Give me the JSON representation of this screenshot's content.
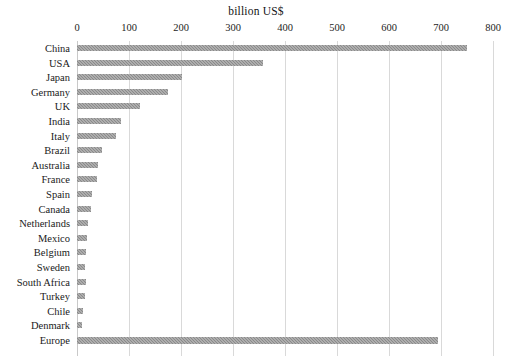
{
  "chart_data": {
    "type": "bar",
    "orientation": "horizontal",
    "title": "billion US$",
    "xlabel": "billion US$",
    "ylabel": "",
    "xlim": [
      0,
      800
    ],
    "xticks": [
      0,
      100,
      200,
      300,
      400,
      500,
      600,
      700,
      800
    ],
    "grid": true,
    "legend": "none",
    "bar_color": "#8a8a8a",
    "categories": [
      "China",
      "USA",
      "Japan",
      "Germany",
      "UK",
      "India",
      "Italy",
      "Brazil",
      "Australia",
      "France",
      "Spain",
      "Canada",
      "Netherlands",
      "Mexico",
      "Belgium",
      "Sweden",
      "South Africa",
      "Turkey",
      "Chile",
      "Denmark",
      "Europe"
    ],
    "values": [
      750,
      358,
      202,
      175,
      122,
      85,
      75,
      48,
      40,
      38,
      28,
      26,
      22,
      19,
      18,
      16,
      17,
      15,
      12,
      10,
      695
    ]
  }
}
